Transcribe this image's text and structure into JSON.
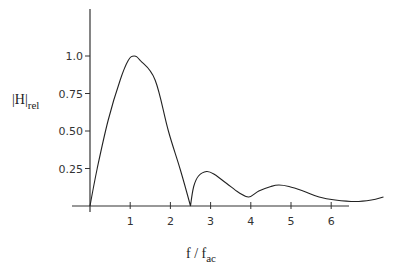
{
  "chart_data": {
    "type": "line",
    "title": "",
    "xlabel": "f / f_ac",
    "xlabel_main": "f / f",
    "xlabel_sub": "ac",
    "ylabel": "|H|_rel",
    "ylabel_main": "|H|",
    "ylabel_sub": "rel",
    "xlim": [
      0,
      7.3
    ],
    "ylim": [
      0,
      1.3
    ],
    "grid": false,
    "legend": "none",
    "x_ticks": [
      1,
      2,
      3,
      4,
      5,
      6
    ],
    "x_tick_labels": [
      "1",
      "2",
      "3",
      "4",
      "5",
      "6"
    ],
    "y_ticks": [
      0.25,
      0.5,
      0.75,
      1.0
    ],
    "y_tick_labels": [
      "0.25",
      "0.50",
      "0.75",
      "1.0"
    ],
    "series": [
      {
        "name": "|H|rel",
        "x": [
          0,
          0.18,
          0.45,
          0.75,
          0.95,
          1.1,
          1.25,
          1.62,
          1.95,
          2.25,
          2.5,
          2.58,
          2.7,
          2.9,
          3.1,
          3.4,
          3.7,
          3.95,
          4.2,
          4.5,
          4.7,
          4.95,
          5.3,
          5.7,
          6.1,
          6.6,
          7.0,
          7.3
        ],
        "values": [
          0,
          0.25,
          0.57,
          0.84,
          0.97,
          1.0,
          0.97,
          0.84,
          0.5,
          0.24,
          0,
          0.13,
          0.2,
          0.23,
          0.21,
          0.15,
          0.09,
          0.06,
          0.1,
          0.13,
          0.14,
          0.13,
          0.1,
          0.06,
          0.04,
          0.03,
          0.04,
          0.06
        ]
      }
    ]
  }
}
